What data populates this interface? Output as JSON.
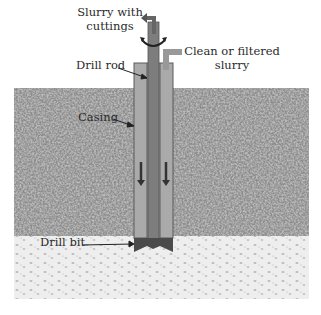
{
  "diagram": {
    "labels": {
      "slurry_out_line1": "Slurry with",
      "slurry_out_line2": "cuttings",
      "slurry_in_line1": "Clean or filtered",
      "slurry_in_line2": "slurry",
      "drill_rod": "Drill rod",
      "casing": "Casing",
      "drill_bit": "Drill bit"
    },
    "layers": [
      {
        "name": "gravel / coarse soil",
        "color": "#8a8a8a"
      },
      {
        "name": "sand",
        "color": "#ececec"
      }
    ],
    "colors": {
      "casing": "#a9a9a9",
      "drill_rod": "#7a7a7a",
      "bit": "#4a4a4a",
      "arrow": "#3a3a3a"
    },
    "flow_arrows": [
      "down",
      "down"
    ]
  }
}
